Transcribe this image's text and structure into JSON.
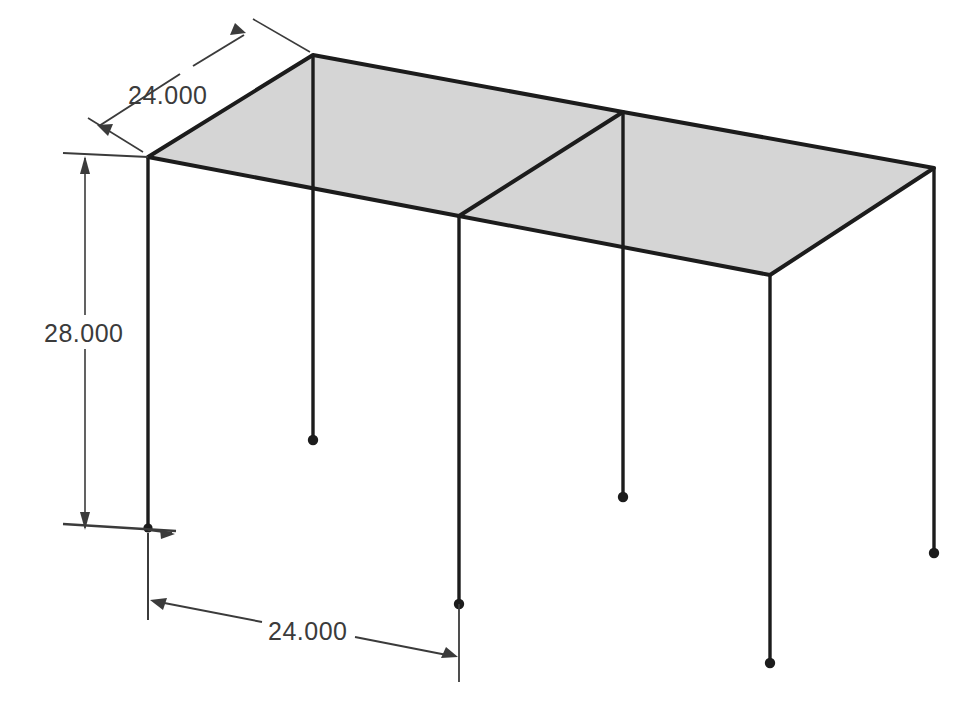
{
  "drawing": {
    "type": "isometric-structural-frame",
    "background_color": "#ffffff",
    "line_color": "#1c1c1c",
    "roof_fill_color": "#d5d5d5",
    "dimension_color": "#3b3b3b",
    "title": "",
    "units_implied": "decimal"
  },
  "dimensions": [
    {
      "id": "bay-depth-top",
      "value": "24.000",
      "orientation": "oblique-leader",
      "location": "upper-left",
      "describes": "roof edge from left corner to back apex"
    },
    {
      "id": "column-height",
      "value": "28.000",
      "orientation": "vertical",
      "location": "left",
      "describes": "column height from roof to base"
    },
    {
      "id": "bay-span-bottom",
      "value": "24.000",
      "orientation": "oblique-horizontal",
      "location": "bottom",
      "describes": "span between first and second column bases"
    }
  ],
  "geometry": {
    "roof_vertices": {
      "back_apex": [
        313,
        55
      ],
      "left_corner": [
        148,
        157
      ],
      "front_mid": [
        459,
        216
      ],
      "front_right": [
        770,
        275
      ],
      "right_corner": [
        934,
        168
      ],
      "back_mid": [
        623,
        112
      ]
    },
    "columns": [
      {
        "name": "column-back-apex",
        "top": [
          313,
          55
        ],
        "base": [
          313,
          440
        ]
      },
      {
        "name": "column-left",
        "top": [
          148,
          157
        ],
        "base": [
          148,
          528
        ]
      },
      {
        "name": "column-front-mid",
        "top": [
          459,
          216
        ],
        "base": [
          459,
          604
        ]
      },
      {
        "name": "column-back-mid",
        "top": [
          623,
          112
        ],
        "base": [
          623,
          497
        ]
      },
      {
        "name": "column-front-right",
        "top": [
          770,
          275
        ],
        "base": [
          770,
          663
        ]
      },
      {
        "name": "column-right",
        "top": [
          934,
          168
        ],
        "base": [
          934,
          553
        ]
      }
    ],
    "roof_divider": {
      "from": [
        623,
        112
      ],
      "to": [
        459,
        216
      ]
    },
    "support_marker": "filled-dot"
  },
  "labels": {
    "top_dimension_text": "24.000",
    "height_dimension_text": "28.000",
    "bottom_dimension_text": "24.000"
  }
}
